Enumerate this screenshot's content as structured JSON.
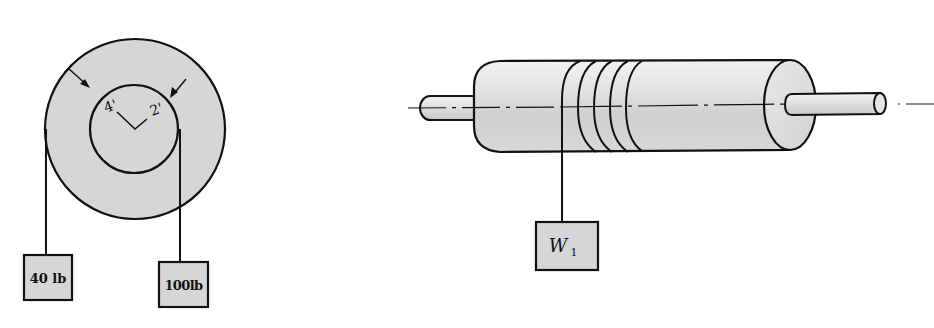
{
  "figure_left": {
    "title": "Stepped pulley with two hanging weights",
    "outer_radius_label": "4'",
    "inner_radius_label": "2'",
    "weight_left_label": "40 lb",
    "weight_right_label": "100lb"
  },
  "figure_right": {
    "title": "Drum on axle with rope wound around",
    "weight_label_main": "W",
    "weight_label_sub": "1"
  },
  "colors": {
    "fill_gray": "#d6d6d6",
    "line": "#111111",
    "background": "#ffffff"
  }
}
